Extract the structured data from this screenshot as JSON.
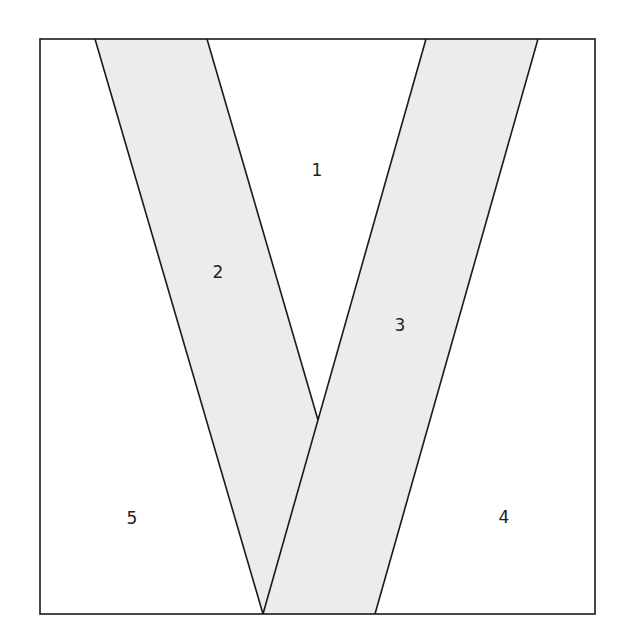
{
  "diagram": {
    "colors": {
      "stripe_fill": "#ececec",
      "line": "#1a1a1a",
      "background": "#ffffff"
    },
    "frame": {
      "x": 40,
      "y": 39,
      "width": 555,
      "height": 575
    },
    "stripes": [
      {
        "name": "left-stripe",
        "points": "95,39 207,39 318,420 263,614"
      },
      {
        "name": "right-stripe",
        "points": "426,39 538,39 375,614 263,614"
      }
    ],
    "lines": [
      {
        "name": "left-stripe-outer-edge",
        "x1": 95,
        "y1": 39,
        "x2": 263,
        "y2": 614
      },
      {
        "name": "left-stripe-inner-edge",
        "x1": 207,
        "y1": 39,
        "x2": 318,
        "y2": 420
      },
      {
        "name": "right-stripe-inner-edge",
        "x1": 426,
        "y1": 39,
        "x2": 263,
        "y2": 614
      },
      {
        "name": "right-stripe-outer-edge",
        "x1": 538,
        "y1": 39,
        "x2": 375,
        "y2": 614
      }
    ],
    "labels": [
      {
        "text": "1",
        "x": 317,
        "y": 176
      },
      {
        "text": "2",
        "x": 218,
        "y": 278
      },
      {
        "text": "3",
        "x": 400,
        "y": 331
      },
      {
        "text": "4",
        "x": 504,
        "y": 523
      },
      {
        "text": "5",
        "x": 132,
        "y": 524
      }
    ]
  }
}
